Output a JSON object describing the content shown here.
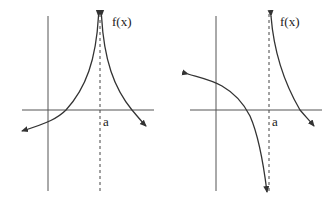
{
  "graphs": [
    {
      "id": "left",
      "function_label": "f(x)",
      "asymptote_label": "a",
      "description": "Both sides approach +infinity near x=a; curve crosses x-axis left and right of a"
    },
    {
      "id": "right",
      "function_label": "f(x)",
      "asymptote_label": "a",
      "description": "Approaches -infinity from left of a and +infinity from right of a"
    }
  ],
  "colors": {
    "stroke": "#333333",
    "axis": "#555555"
  }
}
